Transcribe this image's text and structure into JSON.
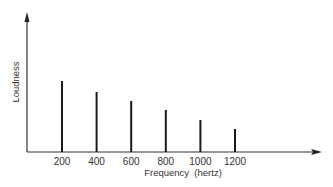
{
  "chart_data": {
    "type": "bar",
    "title": "",
    "xlabel": "Frequency (hertz)",
    "ylabel": "Loudness",
    "categories": [
      "200",
      "400",
      "600",
      "800",
      "1000",
      "1200"
    ],
    "x": [
      200,
      400,
      600,
      800,
      1000,
      1200
    ],
    "values": [
      71,
      60,
      51,
      42,
      32,
      23
    ],
    "value_units": "relative (arbitrary, no y tick labels shown)",
    "ylim": [
      0,
      138
    ],
    "grid": false,
    "legend": null,
    "style": "line spectrum (thin vertical bars)"
  },
  "axes": {
    "x_label": "Frequency  (hertz)",
    "y_label": "Loudness"
  },
  "colors": {
    "bar": "#1a1a1a",
    "axis": "#333333",
    "background": "#ffffff"
  }
}
